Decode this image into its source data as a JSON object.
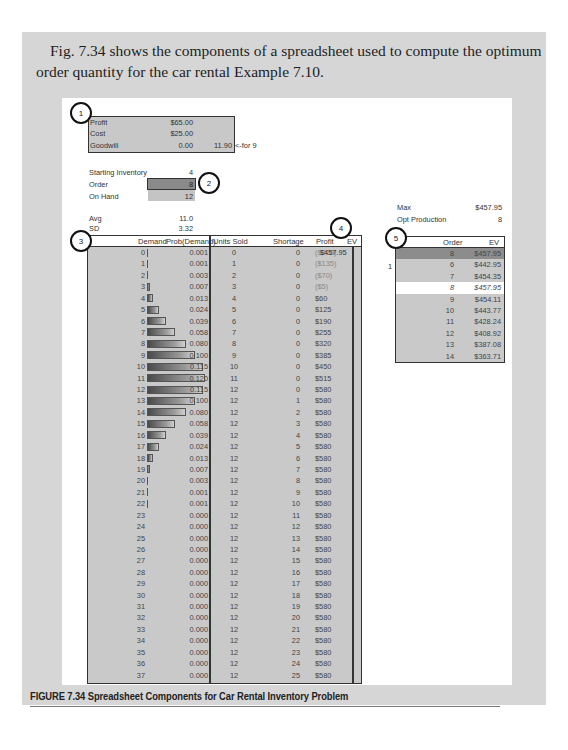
{
  "intro_text": "Fig. 7.34 shows the components of a spreadsheet used to compute the optimum order quantity for the car rental Example 7.10.",
  "callouts": [
    "1",
    "2",
    "3",
    "4",
    "5"
  ],
  "params": {
    "profit_label": "Profit",
    "profit_value": "$65.00",
    "cost_label": "Cost",
    "cost_value": "$25.00",
    "goodwill_label": "Goodwill",
    "goodwill_value": "0.00",
    "goodwill_extra": "11.90",
    "goodwill_note": "<-for 9"
  },
  "inventory": {
    "starting_label": "Starting Inventory",
    "starting_value": "4",
    "order_label": "Order",
    "order_value": "8",
    "onhand_label": "On Hand",
    "onhand_value": "12"
  },
  "stats": {
    "avg_label": "Avg",
    "avg_value": "11.0",
    "sd_label": "SD",
    "sd_value": "3.32"
  },
  "summary": {
    "max_label": "Max",
    "max_value": "$457.95",
    "opt_label": "Opt Production",
    "opt_value": "8"
  },
  "main_table": {
    "headers": {
      "demand": "Demand",
      "prob": "Prob(Demand)",
      "units_sold": "Units Sold",
      "shortage": "Shortage",
      "profit": "Profit",
      "ev": "EV"
    },
    "ev_value": "$457.95",
    "rows": [
      {
        "demand": "0",
        "prob": "0.001",
        "units": "0",
        "short": "0",
        "profit": "($200)"
      },
      {
        "demand": "1",
        "prob": "0.001",
        "units": "1",
        "short": "0",
        "profit": "($135)"
      },
      {
        "demand": "2",
        "prob": "0.003",
        "units": "2",
        "short": "0",
        "profit": "($70)"
      },
      {
        "demand": "3",
        "prob": "0.007",
        "units": "3",
        "short": "0",
        "profit": "($5)"
      },
      {
        "demand": "4",
        "prob": "0.013",
        "units": "4",
        "short": "0",
        "profit": "$60"
      },
      {
        "demand": "5",
        "prob": "0.024",
        "units": "5",
        "short": "0",
        "profit": "$125"
      },
      {
        "demand": "6",
        "prob": "0.039",
        "units": "6",
        "short": "0",
        "profit": "$190"
      },
      {
        "demand": "7",
        "prob": "0.058",
        "units": "7",
        "short": "0",
        "profit": "$255"
      },
      {
        "demand": "8",
        "prob": "0.080",
        "units": "8",
        "short": "0",
        "profit": "$320"
      },
      {
        "demand": "9",
        "prob": "0.100",
        "units": "9",
        "short": "0",
        "profit": "$385"
      },
      {
        "demand": "10",
        "prob": "0.115",
        "units": "10",
        "short": "0",
        "profit": "$450"
      },
      {
        "demand": "11",
        "prob": "0.120",
        "units": "11",
        "short": "0",
        "profit": "$515"
      },
      {
        "demand": "12",
        "prob": "0.115",
        "units": "12",
        "short": "0",
        "profit": "$580"
      },
      {
        "demand": "13",
        "prob": "0.100",
        "units": "12",
        "short": "1",
        "profit": "$580"
      },
      {
        "demand": "14",
        "prob": "0.080",
        "units": "12",
        "short": "2",
        "profit": "$580"
      },
      {
        "demand": "15",
        "prob": "0.058",
        "units": "12",
        "short": "3",
        "profit": "$580"
      },
      {
        "demand": "16",
        "prob": "0.039",
        "units": "12",
        "short": "4",
        "profit": "$580"
      },
      {
        "demand": "17",
        "prob": "0.024",
        "units": "12",
        "short": "5",
        "profit": "$580"
      },
      {
        "demand": "18",
        "prob": "0.013",
        "units": "12",
        "short": "6",
        "profit": "$580"
      },
      {
        "demand": "19",
        "prob": "0.007",
        "units": "12",
        "short": "7",
        "profit": "$580"
      },
      {
        "demand": "20",
        "prob": "0.003",
        "units": "12",
        "short": "8",
        "profit": "$580"
      },
      {
        "demand": "21",
        "prob": "0.001",
        "units": "12",
        "short": "9",
        "profit": "$580"
      },
      {
        "demand": "22",
        "prob": "0.001",
        "units": "12",
        "short": "10",
        "profit": "$580"
      },
      {
        "demand": "23",
        "prob": "0.000",
        "units": "12",
        "short": "11",
        "profit": "$580"
      },
      {
        "demand": "24",
        "prob": "0.000",
        "units": "12",
        "short": "12",
        "profit": "$580"
      },
      {
        "demand": "25",
        "prob": "0.000",
        "units": "12",
        "short": "13",
        "profit": "$580"
      },
      {
        "demand": "26",
        "prob": "0.000",
        "units": "12",
        "short": "14",
        "profit": "$580"
      },
      {
        "demand": "27",
        "prob": "0.000",
        "units": "12",
        "short": "15",
        "profit": "$580"
      },
      {
        "demand": "28",
        "prob": "0.000",
        "units": "12",
        "short": "16",
        "profit": "$580"
      },
      {
        "demand": "29",
        "prob": "0.000",
        "units": "12",
        "short": "17",
        "profit": "$580"
      },
      {
        "demand": "30",
        "prob": "0.000",
        "units": "12",
        "short": "18",
        "profit": "$580"
      },
      {
        "demand": "31",
        "prob": "0.000",
        "units": "12",
        "short": "19",
        "profit": "$580"
      },
      {
        "demand": "32",
        "prob": "0.000",
        "units": "12",
        "short": "20",
        "profit": "$580"
      },
      {
        "demand": "33",
        "prob": "0.000",
        "units": "12",
        "short": "21",
        "profit": "$580"
      },
      {
        "demand": "34",
        "prob": "0.000",
        "units": "12",
        "short": "22",
        "profit": "$580"
      },
      {
        "demand": "35",
        "prob": "0.000",
        "units": "12",
        "short": "23",
        "profit": "$580"
      },
      {
        "demand": "36",
        "prob": "0.000",
        "units": "12",
        "short": "24",
        "profit": "$580"
      },
      {
        "demand": "37",
        "prob": "0.000",
        "units": "12",
        "short": "25",
        "profit": "$580"
      }
    ]
  },
  "order_table": {
    "headers": {
      "order": "Order",
      "ev": "EV"
    },
    "side_label": "1",
    "rows": [
      {
        "order": "8",
        "ev": "$457.95",
        "style": "dark"
      },
      {
        "order": "6",
        "ev": "$442.95",
        "style": "grey"
      },
      {
        "order": "7",
        "ev": "$454.35",
        "style": "grey"
      },
      {
        "order": "8",
        "ev": "$457.95",
        "style": "white"
      },
      {
        "order": "9",
        "ev": "$454.11",
        "style": "grey"
      },
      {
        "order": "10",
        "ev": "$443.77",
        "style": "grey"
      },
      {
        "order": "11",
        "ev": "$428.24",
        "style": "grey"
      },
      {
        "order": "12",
        "ev": "$408.92",
        "style": "grey"
      },
      {
        "order": "13",
        "ev": "$387.08",
        "style": "grey"
      },
      {
        "order": "14",
        "ev": "$363.71",
        "style": "grey"
      }
    ]
  },
  "caption": "FIGURE 7.34  Spreadsheet Components for Car Rental Inventory Problem"
}
